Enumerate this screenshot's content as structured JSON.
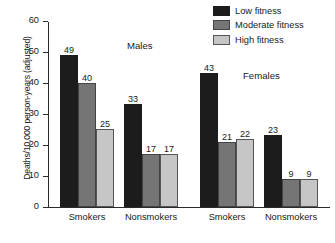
{
  "chart_data": {
    "type": "bar",
    "title": "",
    "xlabel": "",
    "ylabel": "Deaths/10,000 person-years (adjusted)",
    "ylim": [
      0,
      60
    ],
    "yticks": [
      0,
      10,
      20,
      30,
      40,
      50,
      60
    ],
    "ytick_labels": [
      "0",
      "10",
      "20",
      "30",
      "40",
      "50",
      "60"
    ],
    "grid": false,
    "legend_position": "top-right",
    "categories": [
      "Smokers",
      "Nonsmokers",
      "Smokers",
      "Nonsmokers"
    ],
    "panels": [
      {
        "label": "Males",
        "categories": [
          "Smokers",
          "Nonsmokers"
        ]
      },
      {
        "label": "Females",
        "categories": [
          "Smokers",
          "Nonsmokers"
        ]
      }
    ],
    "series": [
      {
        "name": "Low fitness",
        "color": "#1c1c1c",
        "values": [
          49,
          33,
          43,
          23
        ]
      },
      {
        "name": "Moderate fitness",
        "color": "#757575",
        "values": [
          40,
          17,
          21,
          9
        ]
      },
      {
        "name": "High fitness",
        "color": "#c6c6c6",
        "values": [
          25,
          17,
          22,
          9
        ]
      }
    ],
    "groups": [
      {
        "panel": "Males",
        "category": "Smokers",
        "bars": [
          {
            "series": "Low fitness",
            "value": 49,
            "label": "49",
            "class": "low"
          },
          {
            "series": "Moderate fitness",
            "value": 40,
            "label": "40",
            "class": "mod"
          },
          {
            "series": "High fitness",
            "value": 25,
            "label": "25",
            "class": "high"
          }
        ]
      },
      {
        "panel": "Males",
        "category": "Nonsmokers",
        "bars": [
          {
            "series": "Low fitness",
            "value": 33,
            "label": "33",
            "class": "low"
          },
          {
            "series": "Moderate fitness",
            "value": 17,
            "label": "17",
            "class": "mod"
          },
          {
            "series": "High fitness",
            "value": 17,
            "label": "17",
            "class": "high"
          }
        ]
      },
      {
        "panel": "Females",
        "category": "Smokers",
        "bars": [
          {
            "series": "Low fitness",
            "value": 43,
            "label": "43",
            "class": "low"
          },
          {
            "series": "Moderate fitness",
            "value": 21,
            "label": "21",
            "class": "mod"
          },
          {
            "series": "High fitness",
            "value": 22,
            "label": "22",
            "class": "high"
          }
        ]
      },
      {
        "panel": "Females",
        "category": "Nonsmokers",
        "bars": [
          {
            "series": "Low fitness",
            "value": 23,
            "label": "23",
            "class": "low"
          },
          {
            "series": "Moderate fitness",
            "value": 9,
            "label": "9",
            "class": "mod"
          },
          {
            "series": "High fitness",
            "value": 9,
            "label": "9",
            "class": "high"
          }
        ]
      }
    ]
  },
  "axis": {
    "ylabel": "Deaths/10,000 person-years (adjusted)",
    "ticks": [
      "60",
      "50",
      "40",
      "30",
      "20",
      "10",
      "0"
    ]
  },
  "categories": [
    {
      "label": "Smokers"
    },
    {
      "label": "Nonsmokers"
    },
    {
      "label": "Smokers"
    },
    {
      "label": "Nonsmokers"
    }
  ],
  "panel_labels": {
    "males": "Males",
    "females": "Females"
  },
  "legend": {
    "items": [
      {
        "label": "Low fitness",
        "color": "#1c1c1c"
      },
      {
        "label": "Moderate fitness",
        "color": "#757575"
      },
      {
        "label": "High fitness",
        "color": "#c6c6c6"
      }
    ]
  }
}
